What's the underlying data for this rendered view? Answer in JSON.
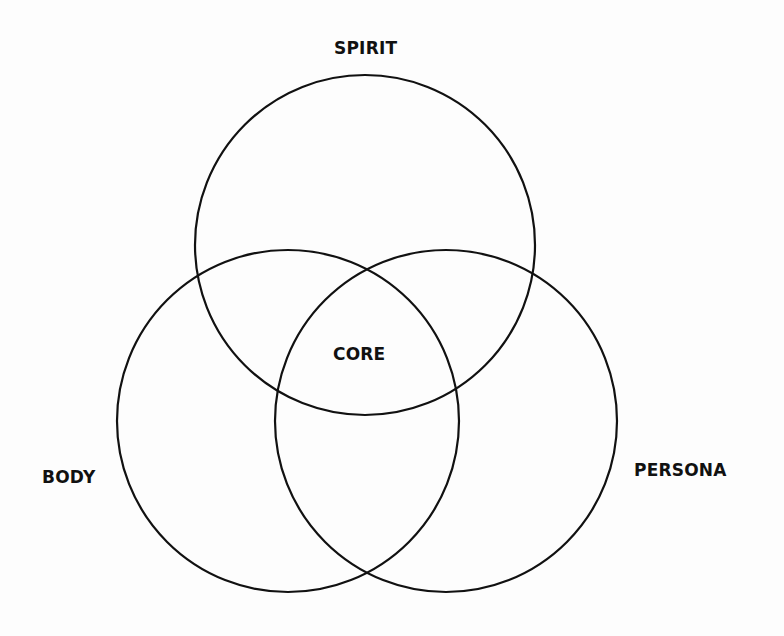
{
  "diagram": {
    "type": "venn",
    "sets": [
      {
        "id": "spirit",
        "label": "SPIRIT",
        "cx": 365,
        "cy": 245,
        "r": 170
      },
      {
        "id": "body",
        "label": "BODY",
        "cx": 288,
        "cy": 421,
        "r": 171
      },
      {
        "id": "persona",
        "label": "PERSONA",
        "cx": 446,
        "cy": 421,
        "r": 171
      }
    ],
    "intersection_label": "CORE",
    "stroke_color": "#111111",
    "background_color": "#fdfdfd"
  },
  "labels": {
    "spirit": "SPIRIT",
    "body": "BODY",
    "persona": "PERSONA",
    "core": "CORE"
  }
}
